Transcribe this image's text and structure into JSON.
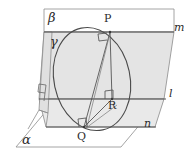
{
  "figure": {
    "width": 184,
    "height": 154
  },
  "colors": {
    "stroke": "#5a5a5a",
    "stroke_light": "#8a8a8a",
    "plane_fill": "#e6e6e6",
    "plane_fill_light": "#efefef",
    "background": "#ffffff",
    "text": "#2b2b2b"
  },
  "labels": {
    "plane_alpha": "α",
    "plane_beta": "β",
    "plane_gamma": "γ",
    "line_l": "l",
    "line_m": "m",
    "line_n": "n",
    "point_p": "P",
    "point_q": "Q",
    "point_r": "R"
  },
  "geometry": {
    "planes": [
      {
        "name": "alpha",
        "label": "α",
        "role": "horizontal-base-plane",
        "points": "18,146 45,112 150,112 124,146"
      },
      {
        "name": "beta",
        "label": "β",
        "role": "upper-vertical-plane",
        "points": "44,9 172,9 172,33 44,33"
      },
      {
        "name": "gamma",
        "label": "γ",
        "role": "slanted-front-plane",
        "points": "44,30 39,110 48,113 52,32"
      }
    ],
    "lines": [
      {
        "name": "m",
        "label": "m",
        "role": "intersection-beta-gamma-top",
        "x1": 44,
        "y1": 32,
        "x2": 172,
        "y2": 32
      },
      {
        "name": "l",
        "label": "l",
        "role": "intersection-mid",
        "x1": 39,
        "y1": 99,
        "x2": 164,
        "y2": 99
      },
      {
        "name": "n",
        "label": "n",
        "role": "lower-edge",
        "x1": 46,
        "y1": 127,
        "x2": 155,
        "y2": 127
      }
    ],
    "points": [
      {
        "name": "P",
        "label": "P",
        "x": 110,
        "y": 32,
        "role": "apex-on-line-m"
      },
      {
        "name": "Q",
        "label": "Q",
        "x": 84,
        "y": 127,
        "role": "foot-on-line-n"
      },
      {
        "name": "R",
        "label": "R",
        "x": 112,
        "y": 99,
        "role": "foot-on-line-l"
      }
    ],
    "segments": [
      {
        "name": "PQ",
        "from": "P",
        "to": "Q"
      },
      {
        "name": "PR",
        "from": "P",
        "to": "R"
      },
      {
        "name": "QR",
        "from": "Q",
        "to": "R"
      }
    ],
    "right_angles": [
      {
        "name": "right-angle-at-P",
        "at": "P"
      },
      {
        "name": "right-angle-at-R",
        "at": "R"
      },
      {
        "name": "right-angle-at-Q",
        "at": "Q"
      },
      {
        "name": "right-angle-gamma-alpha",
        "at": "left-edge"
      }
    ],
    "circle": {
      "name": "great-circle",
      "role": "circle-through-P-and-Q",
      "cx": 92,
      "cy": 79,
      "rx": 40,
      "ry": 52,
      "rotation": -13
    }
  },
  "label_positions": {
    "plane_alpha": {
      "x": 23,
      "y": 133
    },
    "plane_beta": {
      "x": 51,
      "y": 11
    },
    "plane_gamma": {
      "x": 52,
      "y": 34
    },
    "line_m": {
      "x": 172,
      "y": 22
    },
    "line_l": {
      "x": 166,
      "y": 90
    },
    "line_n": {
      "x": 144,
      "y": 118
    },
    "point_p": {
      "x": 104,
      "y": 12
    },
    "point_q": {
      "x": 78,
      "y": 131
    },
    "point_r": {
      "x": 108,
      "y": 100
    }
  }
}
